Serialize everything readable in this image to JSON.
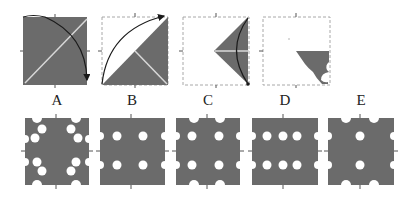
{
  "colors": {
    "fill": "#6b6b6b",
    "background": "#ffffff",
    "dashed_border": "#a8a8a8",
    "crease": "#d8d8d8",
    "arrow": "#1a1a1a"
  },
  "folding_steps": [
    {
      "index": 1,
      "description": "full square with diagonal crease, arrow folding top-left corner down to bottom-right"
    },
    {
      "index": 2,
      "description": "folded into triangle along diagonal, arrow folding bottom-left corner up to top-right"
    },
    {
      "index": 3,
      "description": "folded into smaller triangle on right, curved arrow"
    },
    {
      "index": 4,
      "description": "folded shape with notches cut out"
    }
  ],
  "options": [
    {
      "label": "A"
    },
    {
      "label": "B"
    },
    {
      "label": "C"
    },
    {
      "label": "D"
    },
    {
      "label": "E"
    }
  ]
}
